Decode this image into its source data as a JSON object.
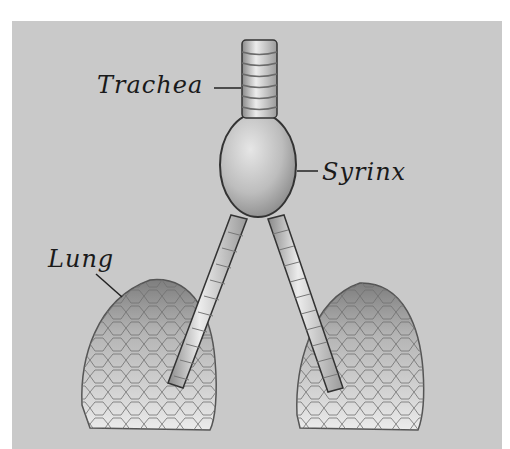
{
  "figure": {
    "background_color": "#c9c9c9",
    "page_color": "#ffffff",
    "ink_color": "#1a1a1a",
    "labels": [
      {
        "id": "trachea",
        "text": "Trachea"
      },
      {
        "id": "syrinx",
        "text": "Syrinx"
      },
      {
        "id": "lung",
        "text": "Lung"
      }
    ]
  }
}
